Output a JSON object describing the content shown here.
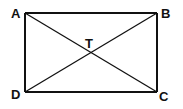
{
  "diagram": {
    "type": "rectangle-with-diagonals",
    "vertices": {
      "A": {
        "label": "A",
        "x": 25,
        "y": 13
      },
      "B": {
        "label": "B",
        "x": 157,
        "y": 13
      },
      "C": {
        "label": "C",
        "x": 157,
        "y": 92
      },
      "D": {
        "label": "D",
        "x": 25,
        "y": 92
      }
    },
    "intersection": {
      "label": "T",
      "x": 91,
      "y": 52
    },
    "segments": [
      "AB",
      "BC",
      "CD",
      "DA",
      "AC",
      "BD"
    ],
    "stroke_color": "#111111"
  }
}
